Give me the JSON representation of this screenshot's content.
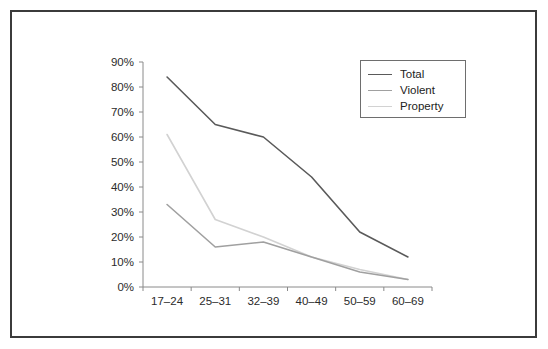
{
  "chart_data": {
    "type": "line",
    "title": "",
    "subtitle": "",
    "xlabel": "",
    "ylabel": "",
    "categories": [
      "17–24",
      "25–31",
      "32–39",
      "40–49",
      "50–59",
      "60–69"
    ],
    "ylim": [
      0,
      90
    ],
    "y_ticks": [
      0,
      10,
      20,
      30,
      40,
      50,
      60,
      70,
      80,
      90
    ],
    "y_tick_labels": [
      "0%",
      "10%",
      "20%",
      "30%",
      "40%",
      "50%",
      "60%",
      "70%",
      "80%",
      "90%"
    ],
    "grid": false,
    "legend_position": "upper-right",
    "series": [
      {
        "name": "Total",
        "color": "#5a5a5a",
        "values": [
          84,
          65,
          60,
          44,
          22,
          12
        ]
      },
      {
        "name": "Violent",
        "color": "#a0a0a0",
        "values": [
          33,
          16,
          18,
          12,
          6,
          3
        ]
      },
      {
        "name": "Property",
        "color": "#d2d2d2",
        "values": [
          61,
          27,
          20,
          12,
          7,
          3
        ]
      }
    ]
  },
  "legend": {
    "entries": [
      {
        "label": "Total",
        "color": "#5a5a5a"
      },
      {
        "label": "Violent",
        "color": "#a0a0a0"
      },
      {
        "label": "Property",
        "color": "#d2d2d2"
      }
    ]
  },
  "axes": {
    "y_tick_labels": [
      "90%",
      "80%",
      "70%",
      "60%",
      "50%",
      "40%",
      "30%",
      "20%",
      "10%",
      "0%"
    ],
    "x_tick_labels": [
      "17–24",
      "25–31",
      "32–39",
      "40–49",
      "50–59",
      "60–69"
    ]
  },
  "colors": {
    "frame": "#3b3b3b",
    "axis": "#8a8a8a",
    "background": "#ffffff",
    "text": "#2b2b2b"
  }
}
